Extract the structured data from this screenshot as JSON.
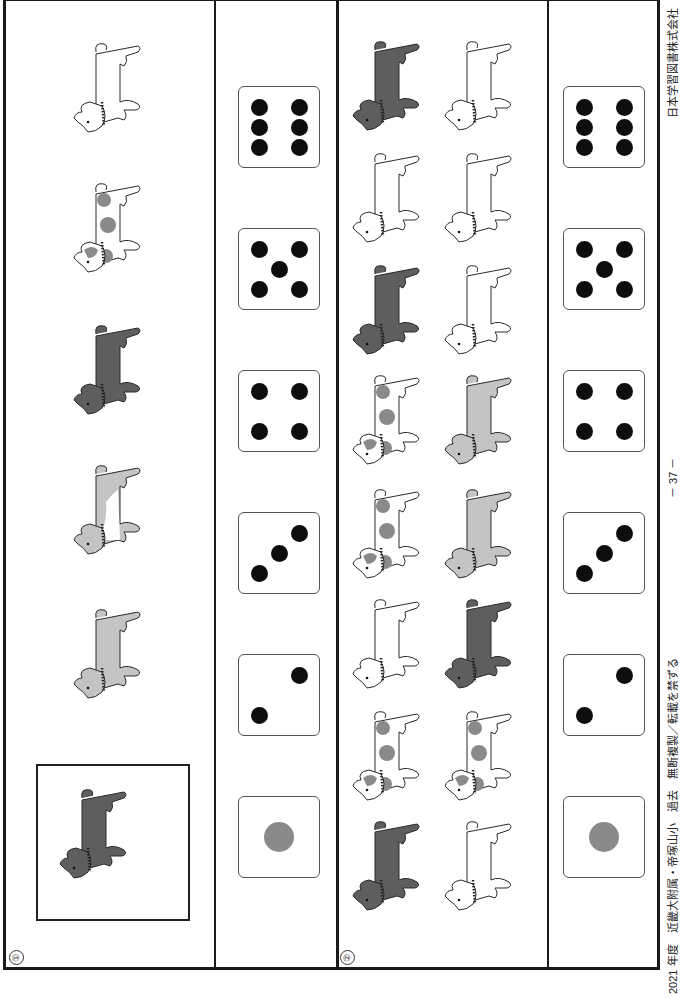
{
  "colors": {
    "black_dog": "#5e5e5e",
    "light_gray_dog": "#c4c4c4",
    "spot": "#8a8a8a",
    "outline": "#2a2a2a",
    "pip": "#0d0d0d",
    "gray_pip": "#8a8a8a"
  },
  "sections": [
    {
      "number": "①",
      "target_animal": "black",
      "animals": [
        "white",
        "spotted",
        "black",
        "tan-white",
        "light-gray"
      ],
      "dice": [
        6,
        5,
        4,
        3,
        2,
        1
      ]
    },
    {
      "number": "②",
      "animal_pairs": [
        [
          "black",
          "white"
        ],
        [
          "white",
          "white"
        ],
        [
          "black",
          "white"
        ],
        [
          "spotted",
          "light-gray"
        ],
        [
          "spotted",
          "light-gray"
        ],
        [
          "white",
          "black"
        ],
        [
          "spotted",
          "spotted"
        ],
        [
          "black",
          "white"
        ]
      ],
      "dice": [
        6,
        5,
        4,
        3,
        2,
        1
      ]
    }
  ],
  "footer": {
    "publisher": "日本学習図書株式会社",
    "page": "－ 37 －",
    "source": "2021 年度　近畿大附属・帝塚山小　過去　無断複製／転載を禁ずる"
  }
}
